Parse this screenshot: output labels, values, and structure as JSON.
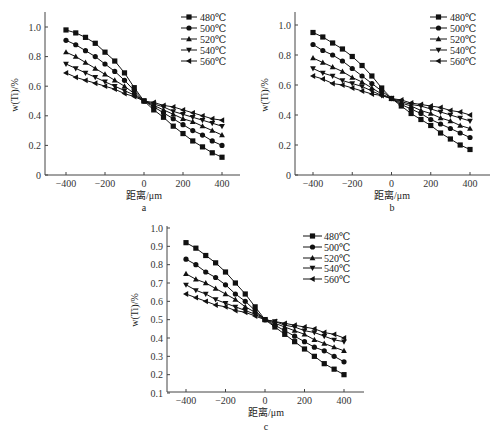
{
  "chart_data": [
    {
      "type": "line",
      "panel_label": "a",
      "xlabel": "距离/μm",
      "ylabel": "w(Ti)/%",
      "xlim": [
        -500,
        500
      ],
      "ylim": [
        0,
        1.1
      ],
      "xticks": [
        -400,
        -200,
        0,
        200,
        400
      ],
      "yticks": [
        0,
        0.2,
        0.4,
        0.6,
        0.8,
        1.0
      ],
      "ytick_labels": [
        "0",
        "0.2",
        "0.4",
        "0.6",
        "0.8",
        "1.0"
      ],
      "grid": false,
      "legend_position": "upper right",
      "x": [
        -400,
        -350,
        -300,
        -250,
        -200,
        -150,
        -100,
        -50,
        0,
        50,
        100,
        150,
        200,
        250,
        300,
        350,
        400
      ],
      "series": [
        {
          "name": "480℃",
          "marker": "square",
          "values": [
            0.98,
            0.96,
            0.93,
            0.89,
            0.83,
            0.77,
            0.69,
            0.59,
            0.5,
            0.44,
            0.39,
            0.33,
            0.28,
            0.23,
            0.19,
            0.15,
            0.12
          ]
        },
        {
          "name": "500℃",
          "marker": "circle",
          "values": [
            0.91,
            0.88,
            0.84,
            0.8,
            0.75,
            0.7,
            0.64,
            0.57,
            0.5,
            0.46,
            0.42,
            0.38,
            0.34,
            0.3,
            0.27,
            0.23,
            0.2
          ]
        },
        {
          "name": "520℃",
          "marker": "triangle-up",
          "values": [
            0.83,
            0.8,
            0.76,
            0.72,
            0.68,
            0.64,
            0.6,
            0.55,
            0.5,
            0.47,
            0.44,
            0.41,
            0.38,
            0.36,
            0.33,
            0.3,
            0.27
          ]
        },
        {
          "name": "540℃",
          "marker": "triangle-down",
          "values": [
            0.75,
            0.72,
            0.69,
            0.66,
            0.63,
            0.6,
            0.57,
            0.54,
            0.5,
            0.48,
            0.46,
            0.43,
            0.41,
            0.39,
            0.37,
            0.35,
            0.33
          ]
        },
        {
          "name": "560℃",
          "marker": "triangle-left",
          "values": [
            0.69,
            0.66,
            0.64,
            0.62,
            0.6,
            0.58,
            0.55,
            0.53,
            0.5,
            0.49,
            0.47,
            0.46,
            0.44,
            0.42,
            0.4,
            0.38,
            0.37
          ]
        }
      ]
    },
    {
      "type": "line",
      "panel_label": "b",
      "xlabel": "距离/μm",
      "ylabel": "w(Ti)/%",
      "xlim": [
        -500,
        500
      ],
      "ylim": [
        0,
        1.1
      ],
      "xticks": [
        -400,
        -200,
        0,
        200,
        400
      ],
      "yticks": [
        0,
        0.2,
        0.4,
        0.6,
        0.8,
        1.0
      ],
      "ytick_labels": [
        "0",
        "0.2",
        "0.4",
        "0.6",
        "0.8",
        "1.0"
      ],
      "grid": false,
      "legend_position": "upper right",
      "x": [
        -400,
        -350,
        -300,
        -250,
        -200,
        -150,
        -100,
        -50,
        0,
        50,
        100,
        150,
        200,
        250,
        300,
        350,
        400
      ],
      "series": [
        {
          "name": "480℃",
          "marker": "square",
          "values": [
            0.95,
            0.92,
            0.88,
            0.84,
            0.79,
            0.73,
            0.66,
            0.58,
            0.51,
            0.46,
            0.41,
            0.37,
            0.33,
            0.28,
            0.24,
            0.2,
            0.17
          ]
        },
        {
          "name": "500℃",
          "marker": "circle",
          "values": [
            0.87,
            0.83,
            0.8,
            0.76,
            0.71,
            0.66,
            0.61,
            0.56,
            0.51,
            0.47,
            0.44,
            0.41,
            0.37,
            0.34,
            0.31,
            0.28,
            0.25
          ]
        },
        {
          "name": "520℃",
          "marker": "triangle-up",
          "values": [
            0.78,
            0.75,
            0.72,
            0.69,
            0.65,
            0.62,
            0.58,
            0.54,
            0.51,
            0.48,
            0.46,
            0.43,
            0.41,
            0.38,
            0.36,
            0.33,
            0.31
          ]
        },
        {
          "name": "540℃",
          "marker": "triangle-down",
          "values": [
            0.71,
            0.68,
            0.66,
            0.63,
            0.61,
            0.59,
            0.56,
            0.53,
            0.51,
            0.49,
            0.47,
            0.46,
            0.44,
            0.42,
            0.4,
            0.38,
            0.36
          ]
        },
        {
          "name": "560℃",
          "marker": "triangle-left",
          "values": [
            0.66,
            0.64,
            0.61,
            0.6,
            0.58,
            0.56,
            0.54,
            0.53,
            0.51,
            0.5,
            0.48,
            0.47,
            0.46,
            0.45,
            0.43,
            0.42,
            0.4
          ]
        }
      ]
    },
    {
      "type": "line",
      "panel_label": "c",
      "xlabel": "距离/μm",
      "ylabel": "w(Ti)/%",
      "xlim": [
        -500,
        500
      ],
      "ylim": [
        0.1,
        1.0
      ],
      "xticks": [
        -400,
        -200,
        0,
        200,
        400
      ],
      "yticks": [
        0.1,
        0.2,
        0.3,
        0.4,
        0.5,
        0.6,
        0.7,
        0.8,
        0.9,
        1.0
      ],
      "ytick_labels": [
        "0.1",
        "0.2",
        "0.3",
        "0.4",
        "0.5",
        "0.6",
        "0.7",
        "0.8",
        "0.9",
        "1.0"
      ],
      "grid": false,
      "legend_position": "upper right",
      "x": [
        -400,
        -350,
        -300,
        -250,
        -200,
        -150,
        -100,
        -50,
        0,
        50,
        100,
        150,
        200,
        250,
        300,
        350,
        400
      ],
      "series": [
        {
          "name": "480℃",
          "marker": "square",
          "values": [
            0.92,
            0.89,
            0.85,
            0.81,
            0.76,
            0.7,
            0.64,
            0.57,
            0.5,
            0.46,
            0.42,
            0.38,
            0.34,
            0.3,
            0.26,
            0.23,
            0.2
          ]
        },
        {
          "name": "500℃",
          "marker": "circle",
          "values": [
            0.83,
            0.8,
            0.76,
            0.73,
            0.69,
            0.64,
            0.6,
            0.55,
            0.5,
            0.47,
            0.44,
            0.41,
            0.38,
            0.35,
            0.33,
            0.3,
            0.27
          ]
        },
        {
          "name": "520℃",
          "marker": "triangle-up",
          "values": [
            0.75,
            0.72,
            0.7,
            0.67,
            0.64,
            0.61,
            0.57,
            0.54,
            0.5,
            0.48,
            0.46,
            0.44,
            0.42,
            0.39,
            0.37,
            0.35,
            0.33
          ]
        },
        {
          "name": "540℃",
          "marker": "triangle-down",
          "values": [
            0.69,
            0.66,
            0.64,
            0.61,
            0.59,
            0.57,
            0.55,
            0.53,
            0.5,
            0.49,
            0.47,
            0.46,
            0.44,
            0.43,
            0.41,
            0.39,
            0.38
          ]
        },
        {
          "name": "560℃",
          "marker": "triangle-left",
          "values": [
            0.64,
            0.62,
            0.6,
            0.58,
            0.57,
            0.55,
            0.54,
            0.52,
            0.5,
            0.49,
            0.48,
            0.47,
            0.46,
            0.45,
            0.43,
            0.42,
            0.4
          ]
        }
      ]
    }
  ],
  "layout": {
    "panels": [
      {
        "axis_left": 45,
        "axis_bottom": 175,
        "axis_top": 12,
        "axis_right": 240,
        "x_px": [
          -400,
          66,
          400,
          222
        ],
        "y_px": [
          0,
          175,
          1.0,
          27
        ],
        "legend": {
          "line_x1": 181,
          "line_x2": 197,
          "text_x": 200,
          "row_y": [
            17,
            28,
            39,
            50,
            61
          ]
        },
        "label_pos": [
          144,
          211
        ],
        "xlabel_pos": [
          144,
          199
        ],
        "ylabel_pos": [
          18,
          95
        ]
      },
      {
        "axis_left": 295,
        "axis_bottom": 175,
        "axis_top": 12,
        "axis_right": 490,
        "x_px": [
          -400,
          313,
          400,
          470
        ],
        "y_px": [
          0,
          175,
          1.0,
          25
        ],
        "legend": {
          "line_x1": 430,
          "line_x2": 447,
          "text_x": 450,
          "row_y": [
            17,
            28,
            39,
            50,
            61
          ]
        },
        "label_pos": [
          392,
          211
        ],
        "xlabel_pos": [
          392,
          199
        ],
        "ylabel_pos": [
          268,
          95
        ]
      },
      {
        "axis_left": 167,
        "axis_bottom": 392,
        "axis_top": 226,
        "axis_right": 364,
        "x_px": [
          -400,
          186,
          400,
          344
        ],
        "y_px": [
          0.1,
          393,
          1.0,
          228
        ],
        "legend": {
          "line_x1": 303,
          "line_x2": 322,
          "text_x": 324,
          "row_y": [
            236,
            247,
            258,
            268,
            279
          ]
        },
        "label_pos": [
          266,
          430
        ],
        "xlabel_pos": [
          266,
          416
        ],
        "ylabel_pos": [
          138,
          310
        ]
      }
    ]
  }
}
